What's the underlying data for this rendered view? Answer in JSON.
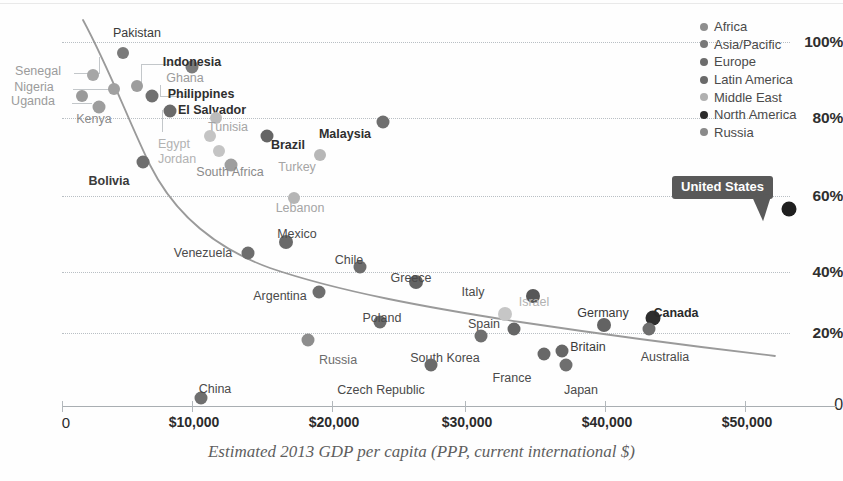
{
  "chart_data": {
    "type": "scatter",
    "title": "",
    "xlabel": "Estimated 2013 GDP per capita (PPP, current international $)",
    "ylabel": "",
    "xlim": [
      0,
      57000
    ],
    "ylim": [
      0,
      105
    ],
    "grid": true,
    "legend_position": "top-right",
    "xticks": [
      "0",
      "$10,000",
      "$20,000",
      "$30,000",
      "$40,000",
      "$50,000"
    ],
    "xtick_values": [
      0,
      10000,
      20000,
      30000,
      40000,
      50000
    ],
    "yticks": [
      "0",
      "20%",
      "40%",
      "60%",
      "80%",
      "100%"
    ],
    "ytick_values": [
      0,
      20,
      40,
      60,
      80,
      100
    ],
    "legend": [
      {
        "name": "Africa",
        "color": "#8e8e8e"
      },
      {
        "name": "Asia/Pacific",
        "color": "#787878"
      },
      {
        "name": "Europe",
        "color": "#6d6d6d"
      },
      {
        "name": "Latin America",
        "color": "#6a6a6a"
      },
      {
        "name": "Middle East",
        "color": "#b0b0b0"
      },
      {
        "name": "North America",
        "color": "#2b2b2b"
      },
      {
        "name": "Russia",
        "color": "#8a8a8a"
      }
    ],
    "points": [
      {
        "name": "Pakistan",
        "x": 4500,
        "y": 97,
        "region": "Asia/Pacific",
        "color": "#7a7a7a",
        "r": 6.0,
        "lx": 137,
        "ly": 33,
        "bold": false,
        "tcolor": "#3a3a3a"
      },
      {
        "name": "Senegal",
        "x": 2300,
        "y": 91,
        "region": "Africa",
        "color": "#a6a6a6",
        "r": 6.0,
        "lx": 38,
        "ly": 71,
        "bold": false,
        "tcolor": "#9b9b9b"
      },
      {
        "name": "Indonesia",
        "x": 9500,
        "y": 93,
        "region": "Asia/Pacific",
        "color": "#7b7b7b",
        "r": 6.5,
        "lx": 192,
        "ly": 62,
        "bold": true,
        "tcolor": "#2f2f2f"
      },
      {
        "name": "Nigeria",
        "x": 5500,
        "y": 88,
        "region": "Africa",
        "color": "#9d9d9d",
        "r": 6.0,
        "lx": 34,
        "ly": 87,
        "bold": false,
        "tcolor": "#9b9b9b"
      },
      {
        "name": "Ghana",
        "x": 3800,
        "y": 87,
        "region": "Africa",
        "color": "#a0a0a0",
        "r": 6.0,
        "lx": 185,
        "ly": 78,
        "bold": false,
        "tcolor": "#9b9b9b"
      },
      {
        "name": "Uganda",
        "x": 1500,
        "y": 85,
        "region": "Africa",
        "color": "#9a9a9a",
        "r": 6.0,
        "lx": 33,
        "ly": 101,
        "bold": false,
        "tcolor": "#9b9b9b"
      },
      {
        "name": "Philippines",
        "x": 6600,
        "y": 85,
        "region": "Asia/Pacific",
        "color": "#707070",
        "r": 6.5,
        "lx": 201,
        "ly": 94,
        "bold": true,
        "tcolor": "#2f2f2f"
      },
      {
        "name": "Kenya",
        "x": 2700,
        "y": 82,
        "region": "Africa",
        "color": "#9d9d9d",
        "r": 6.5,
        "lx": 94,
        "ly": 119,
        "bold": false,
        "tcolor": "#8a8a8a"
      },
      {
        "name": "El Salvador",
        "x": 7900,
        "y": 81,
        "region": "Latin America",
        "color": "#6a6a6a",
        "r": 6.5,
        "lx": 212,
        "ly": 110,
        "bold": true,
        "tcolor": "#2f2f2f"
      },
      {
        "name": "Tunisia",
        "x": 11300,
        "y": 79,
        "region": "Middle East",
        "color": "#bcbcbc",
        "r": 6.0,
        "lx": 228,
        "ly": 127,
        "bold": false,
        "tcolor": "#a5a5a5"
      },
      {
        "name": "Malaysia",
        "x": 23500,
        "y": 78,
        "region": "Asia/Pacific",
        "color": "#6f6f6f",
        "r": 6.5,
        "lx": 345,
        "ly": 134,
        "bold": true,
        "tcolor": "#2f2f2f"
      },
      {
        "name": "Egypt",
        "x": 10800,
        "y": 74,
        "region": "Middle East",
        "color": "#c4c4c4",
        "r": 6.0,
        "lx": 174,
        "ly": 144,
        "bold": false,
        "tcolor": "#b2b2b2"
      },
      {
        "name": "Brazil",
        "x": 15000,
        "y": 74,
        "region": "Latin America",
        "color": "#656565",
        "r": 6.5,
        "lx": 288,
        "ly": 145,
        "bold": true,
        "tcolor": "#2f2f2f"
      },
      {
        "name": "Jordan",
        "x": 11500,
        "y": 70,
        "region": "Middle East",
        "color": "#c4c4c4",
        "r": 6.0,
        "lx": 177,
        "ly": 159,
        "bold": false,
        "tcolor": "#b2b2b2"
      },
      {
        "name": "Turkey",
        "x": 18900,
        "y": 69,
        "region": "Middle East",
        "color": "#b7b7b7",
        "r": 6.0,
        "lx": 297,
        "ly": 167,
        "bold": false,
        "tcolor": "#a5a5a5"
      },
      {
        "name": "Bolivia",
        "x": 5900,
        "y": 67,
        "region": "Latin America",
        "color": "#6e6e6e",
        "r": 6.5,
        "lx": 109,
        "ly": 181,
        "bold": true,
        "tcolor": "#3a3a3a"
      },
      {
        "name": "South Africa",
        "x": 12400,
        "y": 66,
        "region": "Africa",
        "color": "#9e9e9e",
        "r": 6.5,
        "lx": 230,
        "ly": 172,
        "bold": false,
        "tcolor": "#8a8a8a"
      },
      {
        "name": "Lebanon",
        "x": 17000,
        "y": 57,
        "region": "Middle East",
        "color": "#b5b5b5",
        "r": 6.0,
        "lx": 300,
        "ly": 208,
        "bold": false,
        "tcolor": "#a5a5a5"
      },
      {
        "name": "Mexico",
        "x": 16400,
        "y": 45,
        "region": "Latin America",
        "color": "#6a6a6a",
        "r": 7.0,
        "lx": 297,
        "ly": 234,
        "bold": false,
        "tcolor": "#4a4a4a"
      },
      {
        "name": "Venezuela",
        "x": 13600,
        "y": 42,
        "region": "Latin America",
        "color": "#6d6d6d",
        "r": 6.5,
        "lx": 203,
        "ly": 253,
        "bold": false,
        "tcolor": "#4a4a4a"
      },
      {
        "name": "Chile",
        "x": 21800,
        "y": 38,
        "region": "Latin America",
        "color": "#6d6d6d",
        "r": 6.5,
        "lx": 349,
        "ly": 260,
        "bold": false,
        "tcolor": "#4a4a4a"
      },
      {
        "name": "Greece",
        "x": 25900,
        "y": 34,
        "region": "Europe",
        "color": "#636363",
        "r": 7.0,
        "lx": 411,
        "ly": 278,
        "bold": false,
        "tcolor": "#4a4a4a"
      },
      {
        "name": "Argentina",
        "x": 18800,
        "y": 31,
        "region": "Latin America",
        "color": "#6e6e6e",
        "r": 6.5,
        "lx": 280,
        "ly": 296,
        "bold": false,
        "tcolor": "#4a4a4a"
      },
      {
        "name": "Italy",
        "x": 34500,
        "y": 30,
        "region": "Europe",
        "color": "#575757",
        "r": 7.0,
        "lx": 473,
        "ly": 292,
        "bold": false,
        "tcolor": "#4a4a4a"
      },
      {
        "name": "Israel",
        "x": 32400,
        "y": 25,
        "region": "Middle East",
        "color": "#c6c6c6",
        "r": 7.0,
        "lx": 534,
        "ly": 302,
        "bold": false,
        "tcolor": "#b2b2b2"
      },
      {
        "name": "Poland",
        "x": 23300,
        "y": 23,
        "region": "Europe",
        "color": "#6a6a6a",
        "r": 6.5,
        "lx": 382,
        "ly": 318,
        "bold": false,
        "tcolor": "#4a4a4a"
      },
      {
        "name": "Germany",
        "x": 39700,
        "y": 22,
        "region": "Europe",
        "color": "#636363",
        "r": 7.0,
        "lx": 603,
        "ly": 313,
        "bold": false,
        "tcolor": "#3a3a3a"
      },
      {
        "name": "Canada",
        "x": 43300,
        "y": 24,
        "region": "North America",
        "color": "#2e2e2e",
        "r": 7.5,
        "lx": 676,
        "ly": 313,
        "bold": true,
        "tcolor": "#2a2a2a"
      },
      {
        "name": "Spain",
        "x": 33100,
        "y": 21,
        "region": "Europe",
        "color": "#666666",
        "r": 6.5,
        "lx": 484,
        "ly": 324,
        "bold": false,
        "tcolor": "#4a4a4a"
      },
      {
        "name": "Australia",
        "x": 43000,
        "y": 21,
        "region": "Asia/Pacific",
        "color": "#6e6e6e",
        "r": 6.5,
        "lx": 665,
        "ly": 357,
        "bold": false,
        "tcolor": "#4a4a4a"
      },
      {
        "name": "Russia",
        "x": 18000,
        "y": 18,
        "region": "Russia",
        "color": "#8d8d8d",
        "r": 6.5,
        "lx": 338,
        "ly": 360,
        "bold": false,
        "tcolor": "#6c6c6c"
      },
      {
        "name": "South Korea",
        "x": 30700,
        "y": 19,
        "region": "Asia/Pacific",
        "color": "#6f6f6f",
        "r": 6.5,
        "lx": 445,
        "ly": 358,
        "bold": false,
        "tcolor": "#4a4a4a"
      },
      {
        "name": "Britain",
        "x": 36600,
        "y": 15,
        "region": "Europe",
        "color": "#666666",
        "r": 6.5,
        "lx": 588,
        "ly": 347,
        "bold": false,
        "tcolor": "#3a3a3a"
      },
      {
        "name": "France",
        "x": 35300,
        "y": 14,
        "region": "Europe",
        "color": "#686868",
        "r": 6.5,
        "lx": 512,
        "ly": 378,
        "bold": false,
        "tcolor": "#4a4a4a"
      },
      {
        "name": "Japan",
        "x": 36900,
        "y": 11,
        "region": "Asia/Pacific",
        "color": "#6f6f6f",
        "r": 6.5,
        "lx": 581,
        "ly": 390,
        "bold": false,
        "tcolor": "#4a4a4a"
      },
      {
        "name": "Czech Republic",
        "x": 27000,
        "y": 11,
        "region": "Europe",
        "color": "#6a6a6a",
        "r": 6.5,
        "lx": 381,
        "ly": 390,
        "bold": false,
        "tcolor": "#4a4a4a"
      },
      {
        "name": "China",
        "x": 10200,
        "y": 2,
        "region": "Asia/Pacific",
        "color": "#6f6f6f",
        "r": 6.5,
        "lx": 215,
        "ly": 389,
        "bold": false,
        "tcolor": "#4a4a4a"
      },
      {
        "name": "United States",
        "x": 53200,
        "y": 54,
        "region": "North America",
        "color": "#1f1f1f",
        "r": 7.5,
        "lx": 0,
        "ly": 0,
        "bold": true,
        "tcolor": "#ffffff"
      }
    ],
    "trend_line": {
      "present": true,
      "color": "#8d8d8d",
      "description": "Downward decaying curve from upper-left to lower-right"
    },
    "callout": {
      "label": "United States",
      "bg": "#595959",
      "text_color": "#ffffff"
    }
  }
}
